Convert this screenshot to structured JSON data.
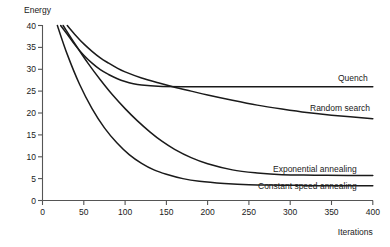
{
  "chart_data": {
    "type": "line",
    "title": "",
    "xlabel": "Iterations",
    "ylabel": "Energy",
    "xlim": [
      0,
      400
    ],
    "ylim": [
      0,
      40
    ],
    "grid": false,
    "legend_position": "inline-right-of-curve",
    "xticks": [
      0,
      50,
      100,
      150,
      200,
      250,
      300,
      350,
      400
    ],
    "xtick_labels": [
      "0",
      "50",
      "100",
      "150",
      "200",
      "250",
      "300",
      "350",
      "400"
    ],
    "yticks": [
      0,
      5,
      10,
      15,
      20,
      25,
      30,
      35,
      40
    ],
    "ytick_labels": [
      "0",
      "5",
      "10",
      "15",
      "20",
      "25",
      "30",
      "35",
      "40"
    ],
    "series": [
      {
        "name": "Quench",
        "label": "Quench",
        "color": "#1a1a1a",
        "x": [
          22,
          30,
          40,
          50,
          60,
          70,
          80,
          90,
          100,
          110,
          120,
          140,
          170,
          200,
          250,
          300,
          350,
          400
        ],
        "y": [
          40.0,
          38.0,
          35.4,
          33.2,
          31.4,
          29.9,
          28.8,
          27.9,
          27.2,
          26.7,
          26.4,
          26.1,
          26.0,
          26.0,
          26.0,
          26.0,
          26.0,
          26.0
        ]
      },
      {
        "name": "Random search",
        "label": "Random search",
        "color": "#1a1a1a",
        "x": [
          30,
          40,
          50,
          60,
          70,
          80,
          90,
          100,
          120,
          140,
          160,
          180,
          200,
          230,
          260,
          290,
          320,
          350,
          400
        ],
        "y": [
          40.0,
          37.8,
          35.8,
          34.1,
          32.6,
          31.4,
          30.3,
          29.4,
          28.0,
          26.9,
          25.9,
          25.0,
          24.1,
          22.9,
          21.8,
          20.9,
          20.1,
          19.5,
          18.7
        ]
      },
      {
        "name": "Exponential annealing",
        "label": "Exponential annealing",
        "color": "#1a1a1a",
        "x": [
          25,
          40,
          55,
          70,
          85,
          100,
          115,
          130,
          145,
          160,
          180,
          200,
          230,
          260,
          290,
          330,
          370,
          400
        ],
        "y": [
          40.0,
          35.6,
          31.4,
          27.6,
          24.1,
          21.0,
          18.2,
          15.7,
          13.5,
          11.7,
          9.8,
          8.4,
          7.0,
          6.3,
          5.9,
          5.8,
          5.7,
          5.7
        ]
      },
      {
        "name": "Constant speed annealing",
        "label": "Constant speed annealing",
        "color": "#1a1a1a",
        "x": [
          18,
          30,
          45,
          60,
          75,
          90,
          105,
          120,
          135,
          150,
          170,
          190,
          220,
          250,
          290,
          330,
          370,
          400
        ],
        "y": [
          40.0,
          33.4,
          26.5,
          21.0,
          16.6,
          13.2,
          10.5,
          8.5,
          7.0,
          6.0,
          5.0,
          4.4,
          3.9,
          3.6,
          3.5,
          3.4,
          3.4,
          3.4
        ]
      }
    ],
    "annotations": [
      {
        "text": "Quench",
        "x_px": 338,
        "y_px": 81
      },
      {
        "text": "Random search",
        "x_px": 310,
        "y_px": 111
      },
      {
        "text": "Exponential annealing",
        "x_px": 273,
        "y_px": 172
      },
      {
        "text": "Constant speed annealing",
        "x_px": 258,
        "y_px": 189
      }
    ]
  },
  "axes": {
    "y_title": "Energy",
    "x_title": "Iterations"
  }
}
